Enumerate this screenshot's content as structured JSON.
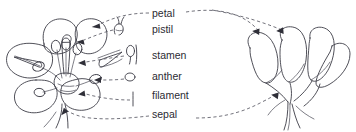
{
  "diagram": {
    "background_color": "#ffffff",
    "line_color": "#3c3c46",
    "text_color": "#2b2b33",
    "leader_color": "#5a5a64"
  },
  "labels": [
    {
      "id": "petal",
      "text": "petal",
      "x": 152,
      "y": 17,
      "icon": "none"
    },
    {
      "id": "pistil",
      "text": "pistil",
      "x": 152,
      "y": 33,
      "icon": "pistil-glyph"
    },
    {
      "id": "stamen",
      "text": "stamen",
      "x": 152,
      "y": 59,
      "icon": "stamen-glyph"
    },
    {
      "id": "anther",
      "text": "anther",
      "x": 152,
      "y": 80,
      "icon": "anther-glyph"
    },
    {
      "id": "filament",
      "text": "filament",
      "x": 152,
      "y": 99,
      "icon": "filament-glyph"
    },
    {
      "id": "sepal",
      "text": "sepal",
      "x": 152,
      "y": 118,
      "icon": "none"
    }
  ],
  "figures": [
    {
      "id": "flower-front-view",
      "view": "front",
      "region": [
        4,
        16,
        112,
        114
      ]
    },
    {
      "id": "flower-side-view",
      "view": "side",
      "region": [
        244,
        26,
        350,
        130
      ]
    }
  ],
  "icons": {
    "pistil_glyph": "pistil-glyph",
    "stamen_glyph": "stamen-glyph",
    "anther_glyph": "anther-glyph",
    "filament_glyph": "filament-glyph"
  }
}
